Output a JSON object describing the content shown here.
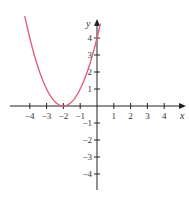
{
  "chart_data": {
    "type": "line",
    "title": "",
    "xlabel": "x",
    "ylabel": "y",
    "xlim": [
      -4.5,
      5.2
    ],
    "ylim": [
      -4.8,
      5.2
    ],
    "grid": false,
    "x_ticks": [
      -4,
      -3,
      -2,
      -1,
      1,
      2,
      3,
      4
    ],
    "y_ticks": [
      4,
      3,
      2,
      1,
      -1,
      -2,
      -3,
      -4
    ],
    "x_tick_labels": [
      "−4",
      "−3",
      "−2",
      "−1",
      "1",
      "2",
      "3",
      "4"
    ],
    "y_tick_labels": [
      "4",
      "3",
      "2",
      "1",
      "−1",
      "−2",
      "−3",
      "−4"
    ],
    "series": [
      {
        "name": "y = (x + 2)^2",
        "color": "#e0607a",
        "x": [
          -4.3,
          -4,
          -3.5,
          -3,
          -2.5,
          -2,
          -1.5,
          -1,
          -0.5,
          0,
          0.2
        ],
        "values": [
          5.29,
          4,
          2.25,
          1,
          0.25,
          0,
          0.25,
          1,
          2.25,
          4,
          4.84
        ]
      }
    ]
  },
  "colors": {
    "curve": "#e0607a",
    "axes": "#222222"
  }
}
